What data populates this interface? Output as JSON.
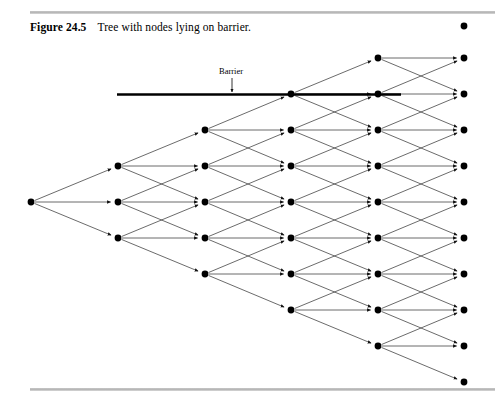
{
  "figure": {
    "number_label": "Figure 24.5",
    "caption": "Tree with nodes lying on barrier.",
    "barrier_label": "Barrier"
  },
  "style": {
    "ink": "#000000",
    "edge_color": "#3a3a3a",
    "rule_color": "#bfbfbf",
    "background": "#ffffff",
    "node_radius": 3.4,
    "edge_width": 0.75,
    "barrier_width": 2.6
  },
  "chart_data": {
    "type": "diagram",
    "title": "Tree with nodes lying on barrier.",
    "geometry": {
      "columns_x": [
        31,
        118,
        205,
        291,
        378,
        464
      ],
      "row_spacing": 36,
      "center_y": 202,
      "nodes_per_column": [
        1,
        3,
        5,
        7,
        9,
        11
      ]
    },
    "barrier": {
      "y": 94.5,
      "x_start": 117,
      "x_end": 401,
      "label": "Barrier",
      "label_x": 231,
      "label_y": 72,
      "arrow_from_y": 78,
      "arrow_to_y": 92,
      "arrow_x": 232,
      "nodes_on_barrier_x": [
        291,
        378
      ]
    },
    "nodes": [
      {
        "col": 0,
        "x": 31,
        "ys": [
          202
        ]
      },
      {
        "col": 1,
        "x": 118,
        "ys": [
          166,
          202,
          238
        ]
      },
      {
        "col": 2,
        "x": 205,
        "ys": [
          130,
          166,
          202,
          238,
          274
        ]
      },
      {
        "col": 3,
        "x": 291,
        "ys": [
          94,
          130,
          166,
          202,
          238,
          274,
          310
        ]
      },
      {
        "col": 4,
        "x": 378,
        "ys": [
          58,
          94,
          130,
          166,
          202,
          238,
          274,
          310,
          346
        ]
      },
      {
        "col": 5,
        "x": 464,
        "ys": [
          26,
          58,
          94,
          130,
          166,
          202,
          238,
          274,
          310,
          346,
          382
        ]
      }
    ],
    "edge_rule": "From each node in column k (k=0..4) three directed edges fan out to the column k+1 nodes at y-36, y, y+36 (up, flat, down), with arrowheads near the destination node."
  }
}
